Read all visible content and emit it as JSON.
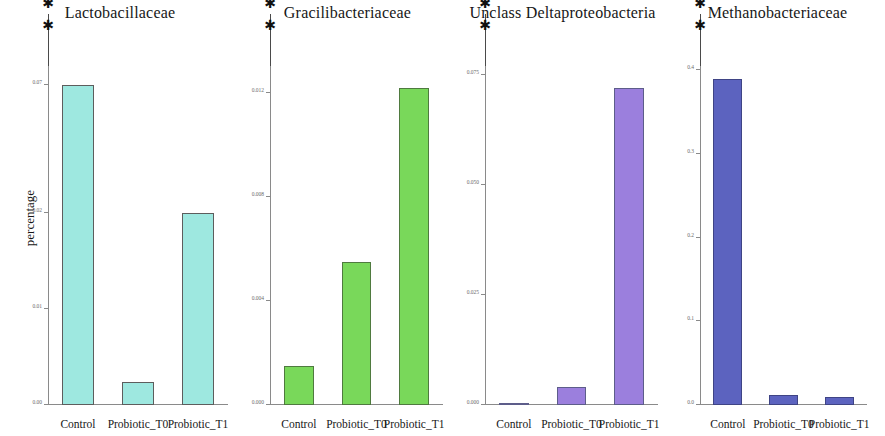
{
  "figure": {
    "ylabel": "percentage",
    "categories": [
      "Control",
      "Probiotic_T0",
      "Probiotic_T1"
    ],
    "significance_marker": "✱"
  },
  "chart_data": [
    {
      "type": "bar",
      "title": "Lactobacillaceae",
      "categories": [
        "Control",
        "Probiotic_T0",
        "Probiotic_T1"
      ],
      "values": [
        0.07,
        0.005,
        0.042
      ],
      "color": "#9ee8e0",
      "edge_color": "#5d5d5d",
      "ylabel": "percentage",
      "xlabel": "",
      "ylim": [
        0,
        0.075
      ],
      "tick_labels": [
        "0.07",
        "0.02",
        "0.01",
        "0.00"
      ],
      "tick_values": [
        0.07,
        0.042,
        0.021,
        0.0
      ],
      "grid": false,
      "annotations": [
        {
          "from": "Control",
          "to": "Probiotic_T0",
          "label": "✱"
        },
        {
          "from": "Probiotic_T0",
          "to": "Probiotic_T1",
          "label": "✱"
        }
      ]
    },
    {
      "type": "bar",
      "title": "Gracilibacteriaceae",
      "categories": [
        "Control",
        "Probiotic_T0",
        "Probiotic_T1"
      ],
      "values": [
        0.0015,
        0.0055,
        0.0122
      ],
      "color": "#79d85a",
      "edge_color": "#4f7a3f",
      "ylabel": "",
      "xlabel": "",
      "ylim": [
        0,
        0.0132
      ],
      "tick_labels": [
        "0.012",
        "0.008",
        "0.004",
        "0.000"
      ],
      "tick_values": [
        0.012,
        0.008,
        0.004,
        0.0
      ],
      "grid": false,
      "annotations": [
        {
          "from": "Control",
          "to": "Probiotic_T1",
          "label": "✱"
        },
        {
          "from": "Probiotic_T0",
          "to": "Probiotic_T1",
          "label": "✱"
        }
      ]
    },
    {
      "type": "bar",
      "title": "Unclass Deltaproteobacteria",
      "categories": [
        "Control",
        "Probiotic_T0",
        "Probiotic_T1"
      ],
      "values": [
        0.0002,
        0.004,
        0.072
      ],
      "color": "#9b7fdd",
      "edge_color": "#5d5d8a",
      "ylabel": "",
      "xlabel": "",
      "ylim": [
        0,
        0.078
      ],
      "tick_labels": [
        "0.075",
        "0.050",
        "0.025",
        "0.000"
      ],
      "tick_values": [
        0.075,
        0.05,
        0.025,
        0.0
      ],
      "grid": false,
      "annotations": [
        {
          "from": "Control",
          "to": "Probiotic_T1",
          "label": "✱"
        },
        {
          "from": "Probiotic_T0",
          "to": "Probiotic_T1",
          "label": "✱"
        }
      ]
    },
    {
      "type": "bar",
      "title": "Methanobacteriaceae",
      "categories": [
        "Control",
        "Probiotic_T0",
        "Probiotic_T1"
      ],
      "values": [
        0.39,
        0.012,
        0.009
      ],
      "color": "#5c63bf",
      "edge_color": "#3f4485",
      "ylabel": "",
      "xlabel": "",
      "ylim": [
        0,
        0.41
      ],
      "tick_labels": [
        "0.4",
        "0.3",
        "0.2",
        "0.1",
        "0.0"
      ],
      "tick_values": [
        0.4,
        0.3,
        0.2,
        0.1,
        0.0
      ],
      "grid": false,
      "annotations": [
        {
          "from": "Control",
          "to": "Probiotic_T0",
          "label": "✱"
        },
        {
          "from": "Probiotic_T0",
          "to": "Probiotic_T1",
          "label": "✱"
        }
      ]
    }
  ]
}
